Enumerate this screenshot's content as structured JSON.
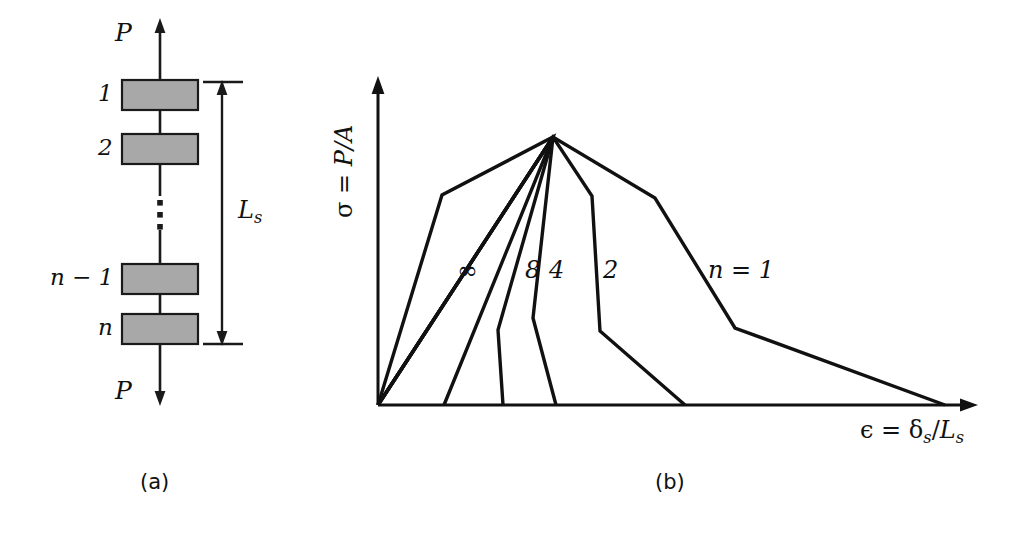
{
  "figure": {
    "type": "two-panel scientific diagram",
    "caption_a": "(a)",
    "caption_b": "(b)"
  },
  "panel_a": {
    "title": "series chain of n blocks loaded by force P",
    "load_top_label": "P",
    "load_bottom_label": "P",
    "length_label": "L",
    "length_label_sub": "s",
    "block_labels": [
      "1",
      "2",
      "n − 1",
      "n"
    ],
    "ellipsis_icon": "vertical-dots-icon",
    "block_fill": "#a8a8a8",
    "block_stroke": "#1a1a1a",
    "blocks": [
      {
        "label": "1",
        "x": 122,
        "y": 80,
        "w": 76,
        "h": 30
      },
      {
        "label": "2",
        "x": 122,
        "y": 134,
        "w": 76,
        "h": 30
      },
      {
        "label": "n − 1",
        "x": 122,
        "y": 264,
        "w": 76,
        "h": 30
      },
      {
        "label": "n",
        "x": 122,
        "y": 314,
        "w": 76,
        "h": 30
      }
    ],
    "dimension_extent": {
      "top_y": 82,
      "bottom_y": 344,
      "x": 218
    }
  },
  "panel_b": {
    "title": "stress-strain response for different numbers of blocks",
    "y_axis_label_sigma": "σ",
    "y_axis_label_eq": " = ",
    "y_axis_label_rhs": "P/A",
    "x_axis_label_eps": "ϵ",
    "x_axis_label_eq": " = ",
    "x_axis_label_num": "δ",
    "x_axis_label_num_sub": "s",
    "x_axis_label_den": "L",
    "x_axis_label_den_sub": "s",
    "curve_labels": [
      "∞",
      "8",
      "4",
      "2",
      "n = 1"
    ],
    "curve_color": "#111111"
  },
  "chart_data": {
    "type": "line",
    "title": "",
    "xlabel": "ϵ = δs/Ls",
    "ylabel": "σ = P/A",
    "grid": false,
    "legend_position": "inline-annotations",
    "axis_origin_px": [
      378,
      405
    ],
    "peak_px": [
      553,
      137
    ],
    "note": "All curves share a common elastic-limit peak; larger n localises and unloads more abruptly.",
    "series": [
      {
        "name": "∞",
        "label_px": [
          460,
          277
        ],
        "points_px": [
          [
            378,
            405
          ],
          [
            442,
            195
          ],
          [
            553,
            137
          ],
          [
            444,
            405
          ]
        ]
      },
      {
        "name": "8",
        "label_px": [
          527,
          277
        ],
        "points_px": [
          [
            378,
            405
          ],
          [
            553,
            137
          ],
          [
            498,
            330
          ],
          [
            503,
            405
          ]
        ]
      },
      {
        "name": "4",
        "label_px": [
          551,
          277
        ],
        "points_px": [
          [
            378,
            405
          ],
          [
            553,
            137
          ],
          [
            533,
            318
          ],
          [
            556,
            405
          ]
        ]
      },
      {
        "name": "2",
        "label_px": [
          604,
          277
        ],
        "points_px": [
          [
            378,
            405
          ],
          [
            553,
            137
          ],
          [
            592,
            196
          ],
          [
            600,
            331
          ],
          [
            685,
            405
          ]
        ]
      },
      {
        "name": "n = 1",
        "label_px": [
          710,
          277
        ],
        "points_px": [
          [
            378,
            405
          ],
          [
            553,
            137
          ],
          [
            655,
            198
          ],
          [
            735,
            328
          ],
          [
            945,
            405
          ]
        ]
      }
    ]
  }
}
